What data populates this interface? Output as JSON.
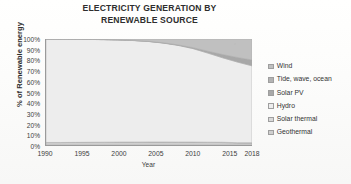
{
  "chart_data": {
    "type": "area",
    "title": "ELECTRICITY GENERATION BY RENEWABLE SOURCE",
    "title_line1": "ELECTRICITY GENERATION BY",
    "title_line2": "RENEWABLE SOURCE",
    "xlabel": "Year",
    "ylabel": "% of Renewable energy",
    "stacked": true,
    "normalized_percent": true,
    "grid": false,
    "legend_position": "right",
    "xlim": [
      1990,
      2018
    ],
    "ylim": [
      0,
      100
    ],
    "xticks": [
      1990,
      1995,
      2000,
      2005,
      2010,
      2015,
      2018
    ],
    "xtick_labels": [
      "1990",
      "1995",
      "2000",
      "2005",
      "2010",
      "2015",
      "2018"
    ],
    "yticks": [
      0,
      10,
      20,
      30,
      40,
      50,
      60,
      70,
      80,
      90,
      100
    ],
    "ytick_labels": [
      "0%",
      "10%",
      "20%",
      "30%",
      "40%",
      "50%",
      "60%",
      "70%",
      "80%",
      "90%",
      "100%"
    ],
    "x": [
      1990,
      1992,
      1994,
      1996,
      1998,
      2000,
      2002,
      2004,
      2006,
      2008,
      2010,
      2012,
      2014,
      2016,
      2018
    ],
    "series": [
      {
        "name": "Wind",
        "color": "#c0c0c0",
        "values": [
          0.0,
          0.1,
          0.2,
          0.3,
          0.5,
          0.8,
          1.3,
          2.2,
          3.6,
          5.6,
          8.2,
          11.5,
          14.6,
          17.4,
          19.8
        ]
      },
      {
        "name": "Tide, wave, ocean",
        "color": "#b3b3b3",
        "values": [
          0.1,
          0.1,
          0.1,
          0.1,
          0.1,
          0.1,
          0.1,
          0.1,
          0.1,
          0.1,
          0.1,
          0.1,
          0.1,
          0.1,
          0.1
        ]
      },
      {
        "name": "Solar PV",
        "color": "#a8a8a8",
        "values": [
          0.0,
          0.0,
          0.0,
          0.0,
          0.0,
          0.0,
          0.1,
          0.1,
          0.2,
          0.4,
          0.8,
          1.7,
          3.0,
          4.2,
          5.4
        ]
      },
      {
        "name": "Hydro",
        "color": "#ededed",
        "values": [
          97.5,
          97.4,
          97.2,
          97.0,
          96.7,
          96.3,
          95.7,
          94.7,
          93.2,
          91.1,
          88.1,
          84.0,
          79.7,
          76.1,
          72.5
        ]
      },
      {
        "name": "Solar thermal",
        "color": "#d9d9d9",
        "values": [
          0.1,
          0.1,
          0.1,
          0.1,
          0.1,
          0.1,
          0.1,
          0.1,
          0.1,
          0.1,
          0.2,
          0.2,
          0.3,
          0.3,
          0.4
        ]
      },
      {
        "name": "Geothermal",
        "color": "#cfcfcf",
        "values": [
          2.3,
          2.3,
          2.4,
          2.5,
          2.6,
          2.7,
          2.7,
          2.8,
          2.8,
          2.7,
          2.6,
          2.5,
          2.3,
          1.9,
          1.8
        ]
      }
    ],
    "legend_entries": [
      {
        "label": "Wind",
        "color": "#c0c0c0"
      },
      {
        "label": "Tide, wave, ocean",
        "color": "#b3b3b3"
      },
      {
        "label": "Solar PV",
        "color": "#a8a8a8"
      },
      {
        "label": "Hydro",
        "color": "#ededed"
      },
      {
        "label": "Solar thermal",
        "color": "#d9d9d9"
      },
      {
        "label": "Geothermal",
        "color": "#cfcfcf"
      }
    ],
    "axis_color": "#9a9a9a",
    "text_color": "#3a3a3a",
    "plot_background": "#fbfbfb"
  }
}
